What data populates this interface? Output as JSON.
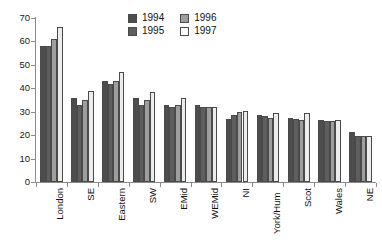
{
  "chart_data": {
    "type": "bar",
    "title": "",
    "subtitle": "",
    "xlabel": "",
    "ylabel": "",
    "ylim": [
      0,
      70
    ],
    "ytick_step": 10,
    "yticks": [
      0,
      10,
      20,
      30,
      40,
      50,
      60,
      70
    ],
    "grid": false,
    "legend_position": "top-center",
    "categories": [
      "London",
      "SE",
      "Eastern",
      "SW",
      "EMid",
      "WEMid",
      "NI",
      "York/Hum",
      "Scot",
      "Wales",
      "NE"
    ],
    "series": [
      {
        "name": "1994",
        "color": "#4d4d4d",
        "values": [
          58,
          36,
          43,
          36,
          33,
          33,
          27,
          28.5,
          27.5,
          26.5,
          21.5
        ]
      },
      {
        "name": "1995",
        "color": "#5e5e5e",
        "values": [
          58,
          33,
          42,
          33,
          32,
          32,
          28.5,
          28,
          27,
          26,
          19.5
        ]
      },
      {
        "name": "1996",
        "color": "#9e9e9e",
        "values": [
          61,
          35,
          43,
          35,
          33,
          32,
          30,
          27.5,
          26.5,
          26,
          19.5
        ]
      },
      {
        "name": "1997",
        "color": "#ececec",
        "values": [
          66,
          39,
          47,
          38.5,
          36,
          32,
          30.5,
          29.5,
          29.5,
          26.5,
          19.5
        ]
      }
    ]
  },
  "legend": {
    "entries": [
      {
        "label": "1994"
      },
      {
        "label": "1996"
      },
      {
        "label": "1995"
      },
      {
        "label": "1997"
      }
    ]
  },
  "axis": {
    "y_tick_labels": [
      "70",
      "60",
      "50",
      "40",
      "30",
      "20",
      "10",
      "0"
    ]
  }
}
